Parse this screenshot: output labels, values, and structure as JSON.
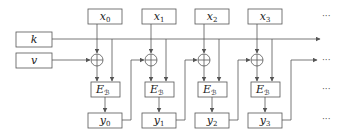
{
  "diagram": {
    "type": "block-cipher-mode",
    "inputs": {
      "key": "k",
      "iv": "v"
    },
    "columns": [
      {
        "plaintext": "x",
        "plaintext_sub": "0",
        "cipher": "E",
        "cipher_sub": "ℬ",
        "output": "y",
        "output_sub": "0"
      },
      {
        "plaintext": "x",
        "plaintext_sub": "1",
        "cipher": "E",
        "cipher_sub": "ℬ",
        "output": "y",
        "output_sub": "1"
      },
      {
        "plaintext": "x",
        "plaintext_sub": "2",
        "cipher": "E",
        "cipher_sub": "ℬ",
        "output": "y",
        "output_sub": "2"
      },
      {
        "plaintext": "x",
        "plaintext_sub": "3",
        "cipher": "E",
        "cipher_sub": "ℬ",
        "output": "y",
        "output_sub": "3"
      }
    ],
    "continuation": "···",
    "colors": {
      "stroke": "#555555",
      "text": "#222222",
      "background": "#ffffff"
    }
  }
}
